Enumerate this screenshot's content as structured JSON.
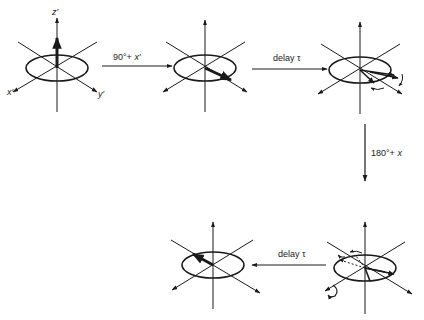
{
  "diagram": {
    "type": "spin-echo-sequence",
    "colors": {
      "ink": "#1a1a1a",
      "background": "#ffffff"
    },
    "frames": [
      {
        "id": "initial",
        "center": [
          57,
          68
        ],
        "axis_labels": {
          "z": "z′",
          "x": "x′",
          "y": "y′"
        },
        "magnetization": "along +z"
      },
      {
        "id": "after-90",
        "center": [
          205,
          68
        ],
        "magnetization": "along +y′"
      },
      {
        "id": "after-delay-1",
        "center": [
          360,
          68
        ],
        "magnetization": "dephasing isochromats in x′y′ plane"
      },
      {
        "id": "after-180",
        "center": [
          360,
          267
        ],
        "magnetization": "reflected isochromats, dashed mirror images"
      },
      {
        "id": "echo",
        "center": [
          213,
          267
        ],
        "magnetization": "refocused along −y′"
      }
    ],
    "transitions": [
      {
        "from": "initial",
        "to": "after-90",
        "label_pre": "90°+ ",
        "label_axis": "x′",
        "direction": "right"
      },
      {
        "from": "after-90",
        "to": "after-delay-1",
        "label": "delay τ",
        "direction": "right"
      },
      {
        "from": "after-delay-1",
        "to": "after-180",
        "label_pre": "180°+ ",
        "label_axis": "x",
        "direction": "down"
      },
      {
        "from": "after-180",
        "to": "echo",
        "label": "delay τ",
        "direction": "left"
      }
    ]
  }
}
